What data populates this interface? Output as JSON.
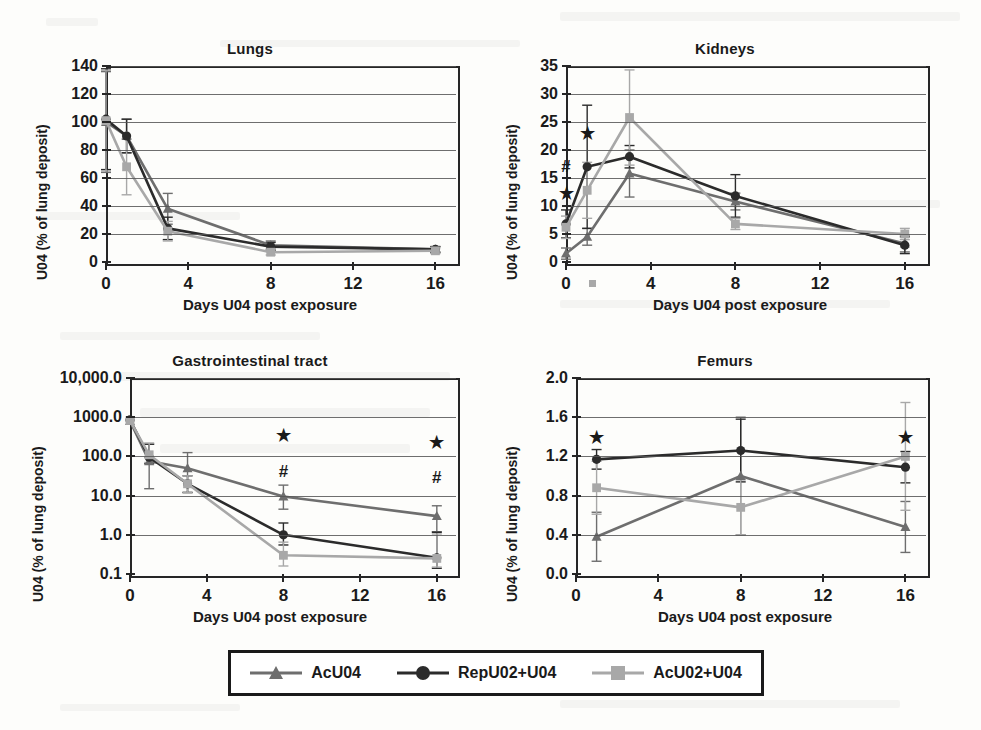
{
  "figure": {
    "axis_label_y": "U04 (% of lung deposit)",
    "axis_label_x": "Days U04 post exposure",
    "significance_star": "★",
    "significance_hash": "#"
  },
  "legend": {
    "items": [
      {
        "label": "AcU04",
        "marker": "triangle",
        "color": "#6e6e6e"
      },
      {
        "label": "RepU02+U04",
        "marker": "circle",
        "color": "#2b2b2b"
      },
      {
        "label": "AcU02+U04",
        "marker": "square",
        "color": "#a8a8a8"
      }
    ]
  },
  "chart_data": [
    {
      "type": "line",
      "title": "Lungs",
      "xlabel": "Days U04 post exposure",
      "ylabel": "U04 (% of lung deposit)",
      "xlim": [
        0,
        17
      ],
      "ylim": [
        0,
        140
      ],
      "yticks": [
        0,
        20,
        40,
        60,
        80,
        100,
        120,
        140
      ],
      "ytick_labels": [
        "0",
        "20",
        "40",
        "60",
        "80",
        "100",
        "120",
        "140"
      ],
      "xticks": [
        0,
        4,
        8,
        12,
        16
      ],
      "xtick_labels": [
        "0",
        "4",
        "8",
        "12",
        "16"
      ],
      "yscale": "linear",
      "grid": true,
      "legend_position": "figure-bottom",
      "x": [
        0,
        1,
        3,
        8,
        16
      ],
      "series": [
        {
          "name": "AcU04",
          "values": [
            100,
            90,
            38,
            12,
            9
          ],
          "err": [
            36,
            12,
            11,
            3,
            2
          ]
        },
        {
          "name": "RepU02+U04",
          "values": [
            102,
            90,
            24,
            11,
            9
          ],
          "err": [
            36,
            12,
            8,
            3,
            2
          ]
        },
        {
          "name": "AcU02+U04",
          "values": [
            101,
            68,
            22,
            7,
            8
          ],
          "err": [
            36,
            20,
            7,
            2,
            2
          ]
        }
      ],
      "annotations": []
    },
    {
      "type": "line",
      "title": "Kidneys",
      "xlabel": "Days U04 post exposure",
      "ylabel": "U04 (% of lung deposit)",
      "xlim": [
        0,
        17
      ],
      "ylim": [
        0,
        35
      ],
      "yticks": [
        0,
        5,
        10,
        15,
        20,
        25,
        30,
        35
      ],
      "ytick_labels": [
        "0",
        "5",
        "10",
        "15",
        "20",
        "25",
        "30",
        "35"
      ],
      "xticks": [
        0,
        4,
        8,
        12,
        16
      ],
      "xtick_labels": [
        "0",
        "4",
        "8",
        "12",
        "16"
      ],
      "yscale": "linear",
      "grid": true,
      "legend_position": "figure-bottom",
      "x": [
        0,
        1,
        3,
        8,
        16
      ],
      "series": [
        {
          "name": "AcU04",
          "values": [
            1.5,
            4.5,
            15.8,
            10.8,
            3.3
          ],
          "err": [
            1.0,
            1.5,
            4.2,
            1.5,
            1.5
          ]
        },
        {
          "name": "RepU02+U04",
          "values": [
            6.8,
            17.0,
            18.8,
            11.8,
            3.0
          ],
          "err": [
            2.5,
            11.0,
            2.0,
            3.8,
            1.5
          ]
        },
        {
          "name": "AcU02+U04",
          "values": [
            6.2,
            12.8,
            25.8,
            6.8,
            5.0
          ],
          "err": [
            2.0,
            5.0,
            8.5,
            1.0,
            1.0
          ]
        }
      ],
      "annotations": [
        {
          "text": "★",
          "x": 0,
          "y": 12.3
        },
        {
          "text": "#",
          "x": 0,
          "y": 17.2
        },
        {
          "text": "★",
          "x": 1,
          "y": 23.0
        }
      ]
    },
    {
      "type": "line",
      "title": "Gastrointestinal tract",
      "xlabel": "Days U04 post exposure",
      "ylabel": "U04 (% of lung deposit)",
      "xlim": [
        0,
        17
      ],
      "ylim": [
        0.1,
        10000
      ],
      "yticks": [
        0.1,
        1.0,
        10.0,
        100.0,
        1000.0,
        10000.0
      ],
      "ytick_labels": [
        "0.1",
        "1.0",
        "10.0",
        "100.0",
        "1000.0",
        "10,000.0"
      ],
      "xticks": [
        0,
        4,
        8,
        12,
        16
      ],
      "xtick_labels": [
        "0",
        "4",
        "8",
        "12",
        "16"
      ],
      "yscale": "log",
      "grid": true,
      "legend_position": "figure-bottom",
      "x": [
        0,
        1,
        3,
        8,
        16
      ],
      "series": [
        {
          "name": "AcU04",
          "values": [
            800,
            75,
            50,
            9.5,
            3.0
          ],
          "err_lo": [
            0,
            60,
            38,
            5.0,
            1.8
          ],
          "err_hi": [
            0,
            130,
            75,
            9.0,
            2.5
          ]
        },
        {
          "name": "RepU02+U04",
          "values": [
            850,
            95,
            20,
            1.0,
            0.26
          ],
          "err_lo": [
            0,
            30,
            8,
            0.45,
            0.12
          ],
          "err_hi": [
            0,
            110,
            12,
            1.0,
            0.9
          ]
        },
        {
          "name": "AcU02+U04",
          "values": [
            820,
            110,
            20,
            0.3,
            0.25
          ],
          "err_lo": [
            0,
            40,
            8,
            0.14,
            0.1
          ],
          "err_hi": [
            0,
            110,
            12,
            0.35,
            0.8
          ]
        }
      ],
      "annotations": [
        {
          "text": "★",
          "x": 8,
          "y": 350
        },
        {
          "text": "#",
          "x": 8,
          "y": 42
        },
        {
          "text": "★",
          "x": 16,
          "y": 230
        },
        {
          "text": "#",
          "x": 16,
          "y": 30
        }
      ]
    },
    {
      "type": "line",
      "title": "Femurs",
      "xlabel": "Days U04 post exposure",
      "ylabel": "U04 (% of lung deposit)",
      "xlim": [
        0,
        17
      ],
      "ylim": [
        0.0,
        2.0
      ],
      "yticks": [
        0.0,
        0.4,
        0.8,
        1.2,
        1.6,
        2.0
      ],
      "ytick_labels": [
        "0.0",
        "0.4",
        "0.8",
        "1.2",
        "1.6",
        "2.0"
      ],
      "xticks": [
        0,
        4,
        8,
        12,
        16
      ],
      "xtick_labels": [
        "0",
        "4",
        "8",
        "12",
        "16"
      ],
      "yscale": "linear",
      "grid": true,
      "legend_position": "figure-bottom",
      "x": [
        1,
        8,
        16
      ],
      "series": [
        {
          "name": "AcU04",
          "values": [
            0.38,
            1.0,
            0.48
          ],
          "err": [
            0.25,
            0.6,
            0.26
          ]
        },
        {
          "name": "RepU02+U04",
          "values": [
            1.17,
            1.26,
            1.09
          ],
          "err": [
            0.1,
            0.32,
            0.16
          ]
        },
        {
          "name": "AcU02+U04",
          "values": [
            0.88,
            0.68,
            1.2
          ],
          "err": [
            0.27,
            0.28,
            0.55
          ]
        }
      ],
      "annotations": [
        {
          "text": "★",
          "x": 1,
          "y": 1.4
        },
        {
          "text": "★",
          "x": 16,
          "y": 1.4
        }
      ]
    }
  ]
}
